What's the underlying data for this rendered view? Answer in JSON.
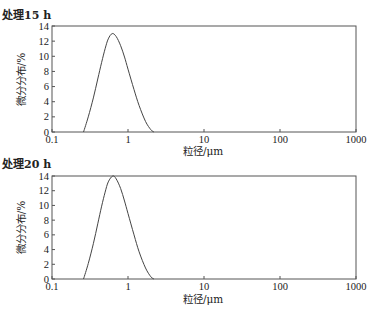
{
  "chart_data": [
    {
      "type": "line",
      "title": "处理15 h",
      "xlabel": "粒径/μm",
      "ylabel": "微分分布/%",
      "xscale": "log",
      "xlim": [
        0.1,
        1000
      ],
      "ylim": [
        0,
        14
      ],
      "xticks": [
        "0.1",
        "1",
        "10",
        "100",
        "1000"
      ],
      "yticks": [
        "0",
        "2",
        "4",
        "6",
        "8",
        "10",
        "12",
        "14"
      ],
      "grid": false,
      "legend": null,
      "series": [
        {
          "name": "处理15 h",
          "x": [
            0.26,
            0.3,
            0.35,
            0.4,
            0.45,
            0.5,
            0.55,
            0.62,
            0.7,
            0.8,
            0.9,
            1.0,
            1.2,
            1.4,
            1.7,
            2.0,
            2.2
          ],
          "y": [
            0,
            2.0,
            4.5,
            7.0,
            9.2,
            11.0,
            12.3,
            13.0,
            12.6,
            11.4,
            9.9,
            8.3,
            5.6,
            3.5,
            1.4,
            0.3,
            0
          ]
        }
      ],
      "peak": {
        "x": 0.62,
        "y": 13.0
      }
    },
    {
      "type": "line",
      "title": "处理20 h",
      "xlabel": "粒径/μm",
      "ylabel": "微分分布/%",
      "xscale": "log",
      "xlim": [
        0.1,
        1000
      ],
      "ylim": [
        0,
        14
      ],
      "xticks": [
        "0.1",
        "1",
        "10",
        "100",
        "1000"
      ],
      "yticks": [
        "0",
        "2",
        "4",
        "6",
        "8",
        "10",
        "12",
        "14"
      ],
      "grid": false,
      "legend": null,
      "series": [
        {
          "name": "处理20 h",
          "x": [
            0.26,
            0.3,
            0.35,
            0.4,
            0.45,
            0.5,
            0.55,
            0.63,
            0.7,
            0.8,
            0.9,
            1.0,
            1.2,
            1.4,
            1.7,
            2.0,
            2.2
          ],
          "y": [
            0,
            2.1,
            4.8,
            7.5,
            9.9,
            11.8,
            13.2,
            14.0,
            13.6,
            12.3,
            10.6,
            8.9,
            6.0,
            3.7,
            1.5,
            0.3,
            0
          ]
        }
      ],
      "peak": {
        "x": 0.63,
        "y": 14.0
      }
    }
  ],
  "panels": [
    {
      "title": "处理15 h",
      "xlabel": "粒径/μm",
      "ylabel": "微分分布/%"
    },
    {
      "title": "处理20 h",
      "xlabel": "粒径/μm",
      "ylabel": "微分分布/%"
    }
  ],
  "style": {
    "axis_color": "#555555",
    "line_color": "#444444",
    "background": "#ffffff"
  }
}
